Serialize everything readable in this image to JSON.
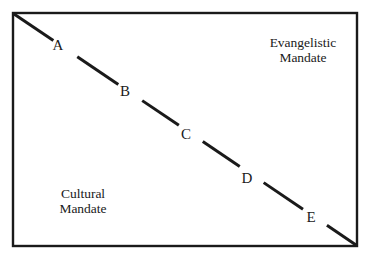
{
  "figure": {
    "type": "continuum-diagram",
    "background_color": "#ffffff",
    "ink_color": "#1a1a1a",
    "frame": {
      "x": 13,
      "y": 13,
      "width": 344,
      "height": 233,
      "stroke_width": 2.4
    },
    "axis": {
      "orientation": "diagonal",
      "from": {
        "x": 14,
        "y": 14
      },
      "to": {
        "x": 356,
        "y": 245
      },
      "stroke_width": 3
    }
  },
  "poles": {
    "upper_right": {
      "name": "evangelistic-mandate",
      "line1": "Evangelistic",
      "line2": "Mandate"
    },
    "lower_left": {
      "name": "cultural-mandate",
      "line1": "Cultural",
      "line2": "Mandate"
    }
  },
  "nodes": [
    {
      "id": "A",
      "label": "A",
      "label_x": 58,
      "label_y": 47,
      "gap_start": 0.115,
      "gap_end": 0.185
    },
    {
      "id": "B",
      "label": "B",
      "label_x": 125,
      "label_y": 93,
      "gap_start": 0.305,
      "gap_end": 0.375
    },
    {
      "id": "C",
      "label": "C",
      "label_x": 186,
      "label_y": 136,
      "gap_start": 0.482,
      "gap_end": 0.552
    },
    {
      "id": "D",
      "label": "D",
      "label_x": 247,
      "label_y": 180,
      "gap_start": 0.66,
      "gap_end": 0.73
    },
    {
      "id": "E",
      "label": "E",
      "label_x": 311,
      "label_y": 219,
      "gap_start": 0.845,
      "gap_end": 0.915
    }
  ],
  "segments": [
    {
      "t_start": 0.0,
      "t_end": 0.115
    },
    {
      "t_start": 0.185,
      "t_end": 0.305
    },
    {
      "t_start": 0.375,
      "t_end": 0.482
    },
    {
      "t_start": 0.552,
      "t_end": 0.66
    },
    {
      "t_start": 0.73,
      "t_end": 0.845
    },
    {
      "t_start": 0.915,
      "t_end": 1.0
    }
  ]
}
